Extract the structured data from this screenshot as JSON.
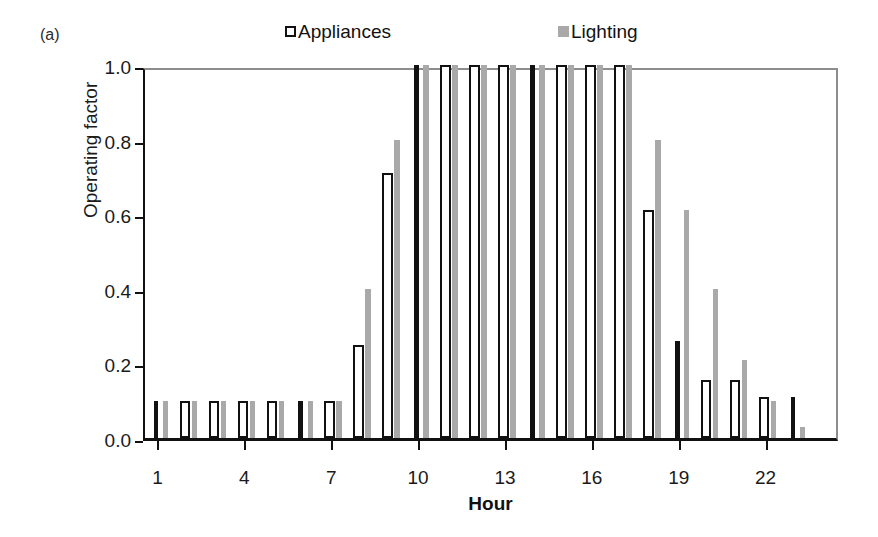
{
  "figure": {
    "panel_label": "(a)"
  },
  "legend": {
    "entries": [
      {
        "label": "Appliances",
        "swatch": "open-square-icon",
        "color": "#ffffff"
      },
      {
        "label": "Lighting",
        "swatch": "filled-square-icon",
        "color": "#a9a9a9"
      }
    ]
  },
  "axes": {
    "y_title": "Operating factor",
    "x_title": "Hour",
    "y_ticks": [
      "0.0",
      "0.2",
      "0.4",
      "0.6",
      "0.8",
      "1.0"
    ],
    "x_ticks": [
      "1",
      "4",
      "7",
      "10",
      "13",
      "16",
      "19",
      "22"
    ]
  },
  "chart_data": {
    "type": "bar",
    "title": "(a)",
    "xlabel": "Hour",
    "ylabel": "Operating factor",
    "ylim": [
      0.0,
      1.0
    ],
    "xlim": [
      0.5,
      24.5
    ],
    "grid": false,
    "legend_position": "top",
    "categories": [
      1,
      2,
      3,
      4,
      5,
      6,
      7,
      8,
      9,
      10,
      11,
      12,
      13,
      14,
      15,
      16,
      17,
      18,
      19,
      20,
      21,
      22,
      23,
      24
    ],
    "series": [
      {
        "name": "Appliances",
        "color": "#ffffff",
        "edge_color": "#111111",
        "values": [
          0.1,
          0.1,
          0.1,
          0.1,
          0.1,
          0.1,
          0.1,
          0.25,
          0.71,
          1.0,
          1.0,
          1.0,
          1.0,
          1.0,
          1.0,
          1.0,
          1.0,
          0.61,
          0.26,
          0.155,
          0.155,
          0.11,
          0.11,
          0.0
        ]
      },
      {
        "name": "Lighting",
        "color": "#a9a9a9",
        "edge_color": "#a9a9a9",
        "values": [
          0.1,
          0.1,
          0.1,
          0.1,
          0.1,
          0.1,
          0.1,
          0.4,
          0.8,
          1.0,
          1.0,
          1.0,
          1.0,
          1.0,
          1.0,
          1.0,
          1.0,
          0.8,
          0.61,
          0.4,
          0.21,
          0.1,
          0.03,
          0.0
        ]
      }
    ]
  }
}
